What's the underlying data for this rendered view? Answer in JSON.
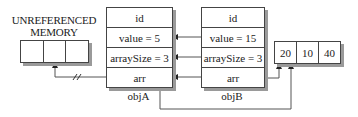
{
  "unreferenced": {
    "title_line1": "UNREFERENCED",
    "title_line2": "MEMORY",
    "cells": [
      "",
      "",
      ""
    ]
  },
  "objA": {
    "label": "objA",
    "rows": [
      "id",
      "value = 5",
      "arraySize = 3",
      "arr"
    ]
  },
  "objB": {
    "label": "objB",
    "rows": [
      "id",
      "value = 15",
      "arraySize = 3",
      "arr"
    ]
  },
  "shared_array": {
    "cells": [
      "20",
      "10",
      "40"
    ]
  },
  "arrows": [
    {
      "from": "objB.value",
      "to": "objA.value",
      "meaning": "copied value"
    },
    {
      "from": "objB.arraySize",
      "to": "objA.arraySize",
      "meaning": "copied value"
    },
    {
      "from": "objB.arr",
      "to": "objA.arr",
      "meaning": "copied pointer"
    },
    {
      "from": "objA.arr",
      "to": "unreferenced",
      "broken": true
    },
    {
      "from": "objA.arr",
      "to": "shared_array"
    },
    {
      "from": "objB.arr",
      "to": "shared_array"
    }
  ],
  "colors": {
    "line": "#444444",
    "shadow": "#9a9a9a"
  }
}
